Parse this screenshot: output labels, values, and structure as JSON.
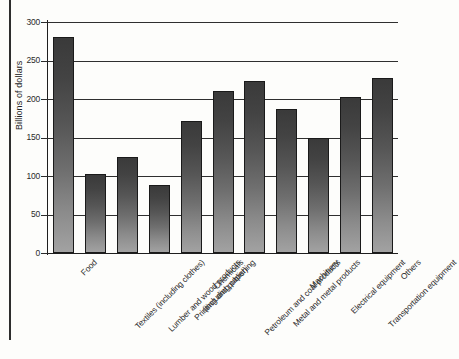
{
  "chart_data": {
    "type": "bar",
    "title": "",
    "xlabel": "",
    "ylabel": "Billions of dollars",
    "ylim": [
      0,
      300
    ],
    "yticks": [
      0,
      50,
      100,
      150,
      200,
      250,
      300
    ],
    "grid": true,
    "legend": "none",
    "categories": [
      "Food",
      "Textiles (including clothes)",
      "Lumber and wood products (including paper)",
      "Printing and publishing",
      "Chemicals",
      "Petroleum and coal products",
      "Metal and metal products",
      "Machinery",
      "Electrical equipment",
      "Transportation equipment",
      "Others"
    ],
    "values": [
      280,
      102,
      125,
      88,
      171,
      210,
      224,
      187,
      150,
      203,
      227
    ],
    "category_lines": [
      [
        "Food"
      ],
      [
        "Textiles (including clothes)"
      ],
      [
        "Lumber and wood products",
        "(including paper)"
      ],
      [
        "Printing and publishing"
      ],
      [
        "Chemicals"
      ],
      [
        "Petroleum and coal products"
      ],
      [
        "Metal and metal products"
      ],
      [
        "Machinery"
      ],
      [
        "Electrical equipment"
      ],
      [
        "Transportation equipment"
      ],
      [
        "Others"
      ]
    ]
  },
  "style": {
    "bar_top_color": "#3a3a3a",
    "bar_bottom_color": "#a2a2a2",
    "axis_color": "#1e1e1e",
    "grid_color": "#2f2f2f",
    "background": "#fdfdfb"
  }
}
